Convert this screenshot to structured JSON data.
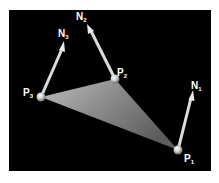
{
  "diagram": {
    "type": "triangle-vertex-normals",
    "background": "#000000",
    "vertices": [
      {
        "id": "P1",
        "label": "P",
        "sub": "1",
        "x": 178,
        "y": 150
      },
      {
        "id": "P2",
        "label": "P",
        "sub": "2",
        "x": 115,
        "y": 79
      },
      {
        "id": "P3",
        "label": "P",
        "sub": "3",
        "x": 41,
        "y": 97
      }
    ],
    "normals": [
      {
        "id": "N1",
        "label": "N",
        "sub": "1",
        "from": "P1",
        "tip_x": 193,
        "tip_y": 92
      },
      {
        "id": "N2",
        "label": "N",
        "sub": "2",
        "from": "P2",
        "tip_x": 88,
        "tip_y": 25
      },
      {
        "id": "N3",
        "label": "N",
        "sub": "3",
        "from": "P3",
        "tip_x": 64,
        "tip_y": 42
      }
    ],
    "labels": {
      "p1": {
        "main": "P",
        "sub": "1"
      },
      "p2": {
        "main": "P",
        "sub": "2"
      },
      "p3": {
        "main": "P",
        "sub": "3"
      },
      "n1": {
        "main": "N",
        "sub": "1"
      },
      "n2": {
        "main": "N",
        "sub": "2"
      },
      "n3": {
        "main": "N",
        "sub": "3"
      }
    }
  }
}
